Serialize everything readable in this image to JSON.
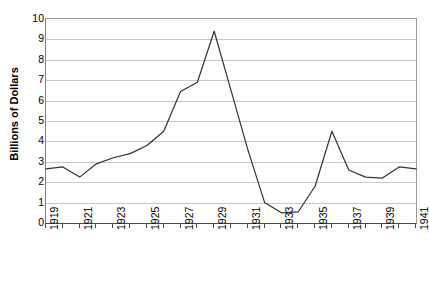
{
  "chart_data": {
    "type": "line",
    "title": "",
    "subtitle": "",
    "xlabel": "",
    "ylabel": "Billions of Dollars",
    "x": [
      1919,
      1920,
      1921,
      1922,
      1923,
      1924,
      1925,
      1926,
      1927,
      1928,
      1929,
      1930,
      1931,
      1932,
      1933,
      1934,
      1935,
      1936,
      1937,
      1938,
      1939,
      1940,
      1941
    ],
    "values": [
      2.65,
      2.75,
      2.25,
      2.9,
      3.2,
      3.4,
      3.8,
      4.5,
      6.45,
      6.9,
      9.4,
      6.5,
      3.6,
      1.0,
      0.5,
      0.55,
      1.8,
      4.5,
      2.6,
      2.25,
      2.2,
      2.75,
      2.65
    ],
    "series": [
      {
        "name": "Billions of Dollars",
        "values": [
          2.65,
          2.75,
          2.25,
          2.9,
          3.2,
          3.4,
          3.8,
          4.5,
          6.45,
          6.9,
          9.4,
          6.5,
          3.6,
          1.0,
          0.5,
          0.55,
          1.8,
          4.5,
          2.6,
          2.25,
          2.2,
          2.75,
          2.65
        ],
        "color": "#333333"
      }
    ],
    "xlim": [
      1919,
      1941
    ],
    "ylim": [
      0,
      10
    ],
    "ytick_labels": [
      "10",
      "9",
      "8",
      "7",
      "6",
      "5",
      "4",
      "3",
      "2",
      "1",
      "0"
    ],
    "ytick_values": [
      10,
      9,
      8,
      7,
      6,
      5,
      4,
      3,
      2,
      1,
      0
    ],
    "xtick_labels": [
      "1919",
      "1921",
      "1923",
      "1925",
      "1927",
      "1929",
      "1931",
      "1933",
      "1935",
      "1937",
      "1939",
      "1941"
    ],
    "xtick_values": [
      1919,
      1921,
      1923,
      1925,
      1927,
      1929,
      1931,
      1933,
      1935,
      1937,
      1939,
      1941
    ],
    "xtick_rotation": -90,
    "grid": "horizontal",
    "legend": "none",
    "line_color": "#333333",
    "grid_color": "#c9c9c9",
    "axis_color": "#4a4a4a",
    "background_color": "#ffffff",
    "annotations": []
  }
}
